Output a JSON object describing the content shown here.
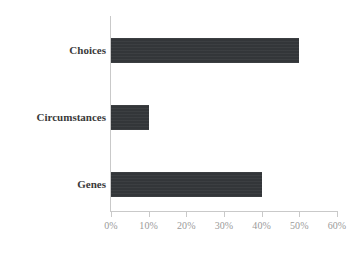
{
  "chart_data": {
    "type": "bar",
    "orientation": "horizontal",
    "title": "",
    "subtitle": "",
    "xlabel": "",
    "ylabel": "",
    "categories": [
      "Choices",
      "Circumstances",
      "Genes"
    ],
    "values": [
      50,
      10,
      40
    ],
    "value_labels": [
      "50%",
      "10%",
      "40%"
    ],
    "xlim": [
      0,
      60
    ],
    "xticks": [
      0,
      10,
      20,
      30,
      40,
      50,
      60
    ],
    "xtick_labels": [
      "0%",
      "10%",
      "20%",
      "30%",
      "40%",
      "50%",
      "60%"
    ],
    "grid": false,
    "legend": false,
    "legend_position": "none",
    "series": [
      {
        "name": "",
        "values": [
          50,
          10,
          40
        ],
        "color": "#333639"
      }
    ],
    "colors": {
      "bar": "#333639",
      "axis": "#c9c9c9",
      "tick_label": "#9a9a9a",
      "category_label": "#3a3a3a",
      "background": "#ffffff"
    }
  }
}
